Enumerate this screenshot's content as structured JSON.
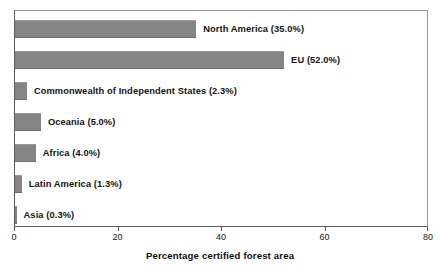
{
  "chart_data": {
    "type": "bar",
    "orientation": "horizontal",
    "title": "",
    "xlabel": "Percentage certified forest area",
    "ylabel": "",
    "xlim": [
      0,
      80
    ],
    "xticks": [
      0,
      20,
      40,
      60,
      80
    ],
    "xtick_labels": [
      "0",
      "20",
      "40",
      "60",
      "80"
    ],
    "grid": false,
    "legend": false,
    "bar_color": "#858585",
    "categories": [
      "North America",
      "EU",
      "Commonwealth of Independent States",
      "Oceania",
      "Africa",
      "Latin America",
      "Asia"
    ],
    "values": [
      35.0,
      52.0,
      2.3,
      5.0,
      4.0,
      1.3,
      0.3
    ],
    "bars": [
      {
        "label": "North America (35.0%)",
        "name": "North America",
        "value": 35.0
      },
      {
        "label": "EU (52.0%)",
        "name": "EU",
        "value": 52.0
      },
      {
        "label": "Commonwealth of Independent States (2.3%)",
        "name": "Commonwealth of Independent States",
        "value": 2.3
      },
      {
        "label": "Oceania (5.0%)",
        "name": "Oceania",
        "value": 5.0
      },
      {
        "label": "Africa (4.0%)",
        "name": "Africa",
        "value": 4.0
      },
      {
        "label": "Latin America (1.3%)",
        "name": "Latin America",
        "value": 1.3
      },
      {
        "label": "Asia (0.3%)",
        "name": "Asia",
        "value": 0.3
      }
    ]
  }
}
